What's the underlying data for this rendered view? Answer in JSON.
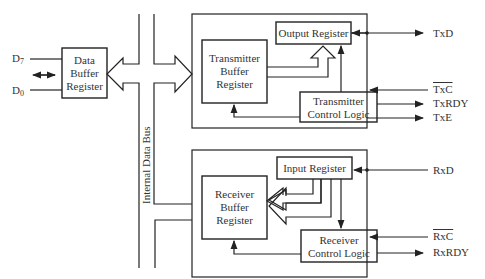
{
  "diagram": {
    "left": {
      "d7_label": "D",
      "d7_sub": "7",
      "d0_label": "D",
      "d0_sub": "0",
      "data_buffer": [
        "Data",
        "Buffer",
        "Register"
      ]
    },
    "bus_label": "Internal Data Bus",
    "transmitter": {
      "output_register": "Output Register",
      "buffer": [
        "Transmitter",
        "Buffer",
        "Register"
      ],
      "control": [
        "Transmitter",
        "Control Logic"
      ],
      "signals": {
        "txd": "TxD",
        "txc": "TxC",
        "txrdy": "TxRDY",
        "txe": "TxE"
      }
    },
    "receiver": {
      "input_register": "Input Register",
      "buffer": [
        "Receiver",
        "Buffer",
        "Register"
      ],
      "control": [
        "Receiver",
        "Control Logic"
      ],
      "signals": {
        "rxd": "RxD",
        "rxc": "RxC",
        "rxrdy": "RxRDY"
      }
    }
  }
}
